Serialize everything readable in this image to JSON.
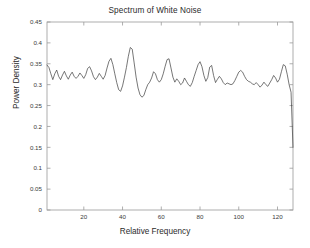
{
  "chart_data": {
    "type": "line",
    "title": "Spectrum of White Noise",
    "xlabel": "Relative Frequency",
    "ylabel": "Power Density",
    "xlim": [
      1,
      128
    ],
    "ylim": [
      0,
      0.45
    ],
    "grid": false,
    "legend": null,
    "xticks": [
      20,
      40,
      60,
      80,
      100,
      120
    ],
    "xtick_labels": [
      "20",
      "40",
      "60",
      "80",
      "100",
      "120"
    ],
    "yticks": [
      0,
      0.05,
      0.1,
      0.15,
      0.2,
      0.25,
      0.3,
      0.35,
      0.4,
      0.45
    ],
    "ytick_labels": [
      "0",
      "0.05",
      "0.1",
      "0.15",
      "0.2",
      "0.25",
      "0.3",
      "0.35",
      "0.4",
      "0.45"
    ],
    "line_color": "#3c3c3c",
    "line_width": 0.7,
    "series": [
      {
        "name": "Power Density",
        "x": [
          1,
          2,
          3,
          4,
          5,
          6,
          7,
          8,
          9,
          10,
          11,
          12,
          13,
          14,
          15,
          16,
          17,
          18,
          19,
          20,
          21,
          22,
          23,
          24,
          25,
          26,
          27,
          28,
          29,
          30,
          31,
          32,
          33,
          34,
          35,
          36,
          37,
          38,
          39,
          40,
          41,
          42,
          43,
          44,
          45,
          46,
          47,
          48,
          49,
          50,
          51,
          52,
          53,
          54,
          55,
          56,
          57,
          58,
          59,
          60,
          61,
          62,
          63,
          64,
          65,
          66,
          67,
          68,
          69,
          70,
          71,
          72,
          73,
          74,
          75,
          76,
          77,
          78,
          79,
          80,
          81,
          82,
          83,
          84,
          85,
          86,
          87,
          88,
          89,
          90,
          91,
          92,
          93,
          94,
          95,
          96,
          97,
          98,
          99,
          100,
          101,
          102,
          103,
          104,
          105,
          106,
          107,
          108,
          109,
          110,
          111,
          112,
          113,
          114,
          115,
          116,
          117,
          118,
          119,
          120,
          121,
          122,
          123,
          124,
          125,
          126,
          127,
          128
        ],
        "y": [
          0.347,
          0.341,
          0.326,
          0.312,
          0.326,
          0.335,
          0.32,
          0.312,
          0.323,
          0.332,
          0.321,
          0.313,
          0.323,
          0.33,
          0.32,
          0.315,
          0.32,
          0.328,
          0.322,
          0.315,
          0.324,
          0.339,
          0.343,
          0.333,
          0.319,
          0.312,
          0.318,
          0.327,
          0.32,
          0.313,
          0.322,
          0.34,
          0.356,
          0.363,
          0.348,
          0.326,
          0.305,
          0.288,
          0.284,
          0.297,
          0.318,
          0.341,
          0.368,
          0.389,
          0.385,
          0.352,
          0.318,
          0.292,
          0.276,
          0.27,
          0.274,
          0.288,
          0.3,
          0.306,
          0.316,
          0.331,
          0.326,
          0.312,
          0.306,
          0.312,
          0.326,
          0.344,
          0.36,
          0.362,
          0.34,
          0.318,
          0.306,
          0.314,
          0.308,
          0.3,
          0.304,
          0.316,
          0.308,
          0.3,
          0.296,
          0.305,
          0.32,
          0.334,
          0.348,
          0.355,
          0.343,
          0.322,
          0.308,
          0.317,
          0.342,
          0.346,
          0.322,
          0.305,
          0.313,
          0.32,
          0.314,
          0.305,
          0.3,
          0.304,
          0.302,
          0.3,
          0.302,
          0.31,
          0.32,
          0.33,
          0.334,
          0.33,
          0.32,
          0.312,
          0.308,
          0.306,
          0.302,
          0.3,
          0.305,
          0.3,
          0.294,
          0.299,
          0.306,
          0.3,
          0.296,
          0.304,
          0.312,
          0.322,
          0.316,
          0.306,
          0.313,
          0.331,
          0.348,
          0.345,
          0.325,
          0.3,
          0.282,
          0.15
        ],
        "max_value": 0.389,
        "max_at_x": 44,
        "min_value": 0.15,
        "min_at_x": 128
      }
    ]
  },
  "axes": {
    "title_text": "Spectrum of White Noise",
    "x_axis_title": "Relative Frequency",
    "y_axis_title": "Power Density"
  }
}
